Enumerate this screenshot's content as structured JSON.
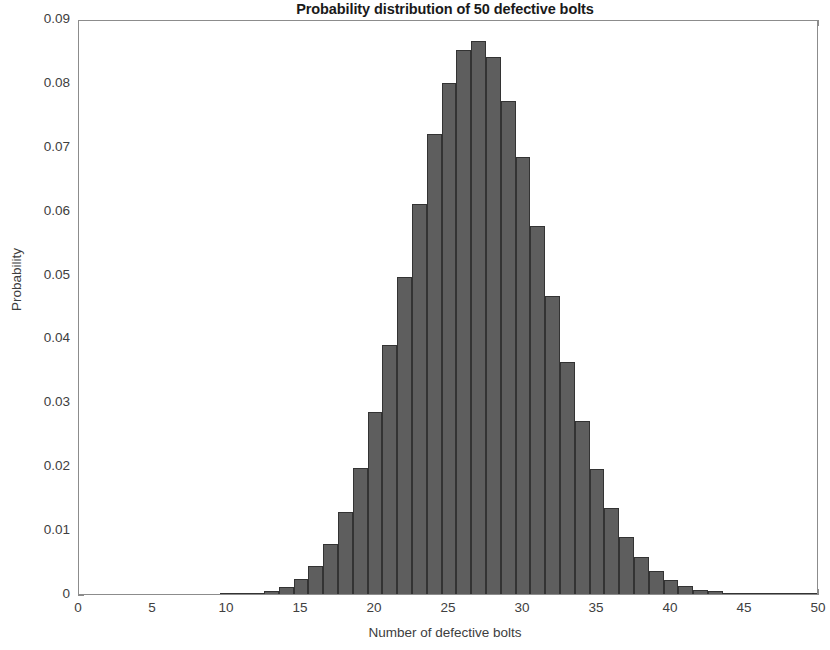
{
  "chart_data": {
    "type": "bar",
    "title": "Probability distribution of 50 defective bolts",
    "xlabel": "Number of defective bolts",
    "ylabel": "Probability",
    "xlim": [
      0,
      50
    ],
    "ylim": [
      0,
      0.09
    ],
    "grid": false,
    "legend": null,
    "bar_color": "#5e5e5e",
    "bar_edge_color": "#333333",
    "xticks": [
      0,
      5,
      10,
      15,
      20,
      25,
      30,
      35,
      40,
      45,
      50
    ],
    "xtick_labels": [
      "0",
      "5",
      "10",
      "15",
      "20",
      "25",
      "30",
      "35",
      "40",
      "45",
      "50"
    ],
    "yticks": [
      0,
      0.01,
      0.02,
      0.03,
      0.04,
      0.05,
      0.06,
      0.07,
      0.08,
      0.09
    ],
    "ytick_labels": [
      "0",
      "0.01",
      "0.02",
      "0.03",
      "0.04",
      "0.05",
      "0.06",
      "0.07",
      "0.08",
      "0.09"
    ],
    "categories": [
      10,
      11,
      12,
      13,
      14,
      15,
      16,
      17,
      18,
      19,
      20,
      21,
      22,
      23,
      24,
      25,
      26,
      27,
      28,
      29,
      30,
      31,
      32,
      33,
      34,
      35,
      36,
      37,
      38,
      39,
      40,
      41,
      42,
      43,
      44,
      45,
      46,
      47,
      48,
      49,
      50
    ],
    "values": [
      0.0,
      0.0001,
      0.0002,
      0.0005,
      0.0011,
      0.0023,
      0.0044,
      0.0078,
      0.0128,
      0.0197,
      0.0285,
      0.039,
      0.0496,
      0.061,
      0.072,
      0.08,
      0.0852,
      0.0866,
      0.084,
      0.0772,
      0.0684,
      0.0576,
      0.0466,
      0.0363,
      0.0271,
      0.0195,
      0.0135,
      0.009,
      0.0058,
      0.0036,
      0.0022,
      0.0013,
      0.0007,
      0.0004,
      0.0002,
      0.0001,
      0.0001,
      0.0,
      0.0,
      0.0,
      0.0
    ]
  }
}
